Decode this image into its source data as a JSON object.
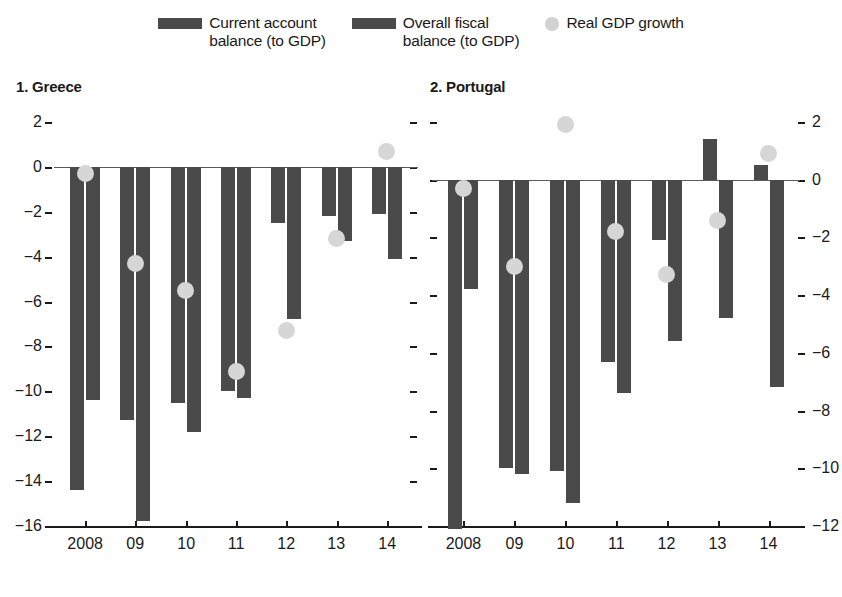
{
  "legend": {
    "items": [
      {
        "name": "current-account-balance",
        "type": "bar",
        "line1": "Current account",
        "line2": "balance (to GDP)",
        "color": "#4a4a4a"
      },
      {
        "name": "overall-fiscal-balance",
        "type": "bar",
        "line1": "Overall fiscal",
        "line2": "balance (to GDP)",
        "color": "#4a4a4a"
      },
      {
        "name": "real-gdp-growth",
        "type": "dot",
        "line1": "Real GDP growth",
        "line2": "",
        "color": "#d2d2d2"
      }
    ]
  },
  "panels": [
    {
      "title": "1. Greece",
      "axis_side": "left",
      "ylim": [
        -16,
        2
      ],
      "yticks": [
        2,
        0,
        -2,
        -4,
        -6,
        -8,
        -10,
        -12,
        -14,
        -16
      ],
      "ytick_labels": [
        "2",
        "0",
        "−2",
        "−4",
        "−6",
        "−8",
        "−10",
        "−12",
        "−14",
        "−16"
      ],
      "categories": [
        "2008",
        "09",
        "10",
        "11",
        "12",
        "13",
        "14"
      ],
      "series": [
        {
          "name": "Current account balance (to GDP)",
          "values": [
            -14.4,
            -11.3,
            -10.5,
            -10.0,
            -2.5,
            -2.2,
            -2.1
          ]
        },
        {
          "name": "Overall fiscal balance (to GDP)",
          "values": [
            -10.4,
            -15.8,
            -11.8,
            -10.3,
            -6.8,
            -3.3,
            -4.1
          ]
        },
        {
          "name": "Real GDP growth",
          "values": [
            -0.3,
            -4.3,
            -5.5,
            -9.1,
            -7.3,
            -3.2,
            0.7
          ]
        }
      ]
    },
    {
      "title": "2. Portugal",
      "axis_side": "right",
      "ylim": [
        -12,
        2
      ],
      "yticks": [
        2,
        0,
        -2,
        -4,
        -6,
        -8,
        -10,
        -12
      ],
      "ytick_labels": [
        "2",
        "0",
        "−2",
        "−4",
        "−6",
        "−8",
        "−10",
        "−12"
      ],
      "categories": [
        "2008",
        "09",
        "10",
        "11",
        "12",
        "13",
        "14"
      ],
      "series": [
        {
          "name": "Current account balance (to GDP)",
          "values": [
            -12.1,
            -10.0,
            -10.1,
            -6.3,
            -2.1,
            1.4,
            0.5
          ]
        },
        {
          "name": "Overall fiscal balance (to GDP)",
          "values": [
            -3.8,
            -10.2,
            -11.2,
            -7.4,
            -5.6,
            -4.8,
            -7.2
          ]
        },
        {
          "name": "Real GDP growth",
          "values": [
            -0.3,
            -3.0,
            1.9,
            -1.8,
            -3.3,
            -1.4,
            0.9
          ]
        }
      ]
    }
  ],
  "chart_data": {
    "type": "bar",
    "title": "",
    "xlabel": "",
    "ylabel": "",
    "grid": false,
    "legend_position": "top",
    "categories": [
      "2008",
      "09",
      "10",
      "11",
      "12",
      "13",
      "14"
    ],
    "panels": [
      {
        "panel_title": "1. Greece",
        "ylim": [
          -16,
          2
        ],
        "ytick_values": [
          2,
          0,
          -2,
          -4,
          -6,
          -8,
          -10,
          -12,
          -14,
          -16
        ],
        "axis_side": "left",
        "series": [
          {
            "name": "Current account balance (to GDP)",
            "type": "bar",
            "values": [
              -14.4,
              -11.3,
              -10.5,
              -10.0,
              -2.5,
              -2.2,
              -2.1
            ]
          },
          {
            "name": "Overall fiscal balance (to GDP)",
            "type": "bar",
            "values": [
              -10.4,
              -15.8,
              -11.8,
              -10.3,
              -6.8,
              -3.3,
              -4.1
            ]
          },
          {
            "name": "Real GDP growth",
            "type": "scatter",
            "values": [
              -0.3,
              -4.3,
              -5.5,
              -9.1,
              -7.3,
              -3.2,
              0.7
            ]
          }
        ]
      },
      {
        "panel_title": "2. Portugal",
        "ylim": [
          -12,
          2
        ],
        "ytick_values": [
          2,
          0,
          -2,
          -4,
          -6,
          -8,
          -10,
          -12
        ],
        "axis_side": "right",
        "series": [
          {
            "name": "Current account balance (to GDP)",
            "type": "bar",
            "values": [
              -12.1,
              -10.0,
              -10.1,
              -6.3,
              -2.1,
              1.4,
              0.5
            ]
          },
          {
            "name": "Overall fiscal balance (to GDP)",
            "type": "bar",
            "values": [
              -3.8,
              -10.2,
              -11.2,
              -7.4,
              -5.6,
              -4.8,
              -7.2
            ]
          },
          {
            "name": "Real GDP growth",
            "type": "scatter",
            "values": [
              -0.3,
              -3.0,
              1.9,
              -1.8,
              -3.3,
              -1.4,
              0.9
            ]
          }
        ]
      }
    ]
  }
}
